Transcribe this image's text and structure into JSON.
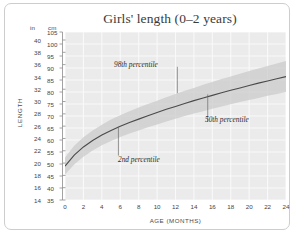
{
  "chart_data": {
    "type": "line",
    "title": "Girls' length (0–2 years)",
    "xlabel": "AGE (MONTHS)",
    "ylabel": "LENGTH",
    "grid": true,
    "legend": "none",
    "y_units": [
      "in",
      "cm"
    ],
    "xlim": [
      0,
      24
    ],
    "ylim_cm": [
      35,
      105
    ],
    "ylim_in": [
      14,
      41.3
    ],
    "xticks": [
      0,
      2,
      4,
      6,
      8,
      10,
      12,
      14,
      16,
      18,
      20,
      22,
      24
    ],
    "yticks_cm": [
      35,
      40,
      45,
      50,
      55,
      60,
      65,
      70,
      75,
      80,
      85,
      90,
      95,
      100,
      105
    ],
    "yticks_in": [
      14,
      16,
      18,
      20,
      22,
      24,
      26,
      28,
      30,
      32,
      34,
      36,
      38,
      40
    ],
    "x": [
      0,
      1,
      2,
      3,
      4,
      5,
      6,
      7,
      8,
      9,
      10,
      11,
      12,
      13,
      14,
      15,
      16,
      17,
      18,
      19,
      20,
      21,
      22,
      23,
      24
    ],
    "series": [
      {
        "name": "2nd percentile",
        "units": "cm",
        "values": [
          45.6,
          49.8,
          53.0,
          55.6,
          57.8,
          59.6,
          61.2,
          62.7,
          64.0,
          65.3,
          66.5,
          67.7,
          68.9,
          70.0,
          71.0,
          72.0,
          73.0,
          74.0,
          74.9,
          75.8,
          76.7,
          77.5,
          78.4,
          79.2,
          80.0
        ]
      },
      {
        "name": "50th percentile",
        "units": "cm",
        "values": [
          49.1,
          53.7,
          57.1,
          59.8,
          62.1,
          64.0,
          65.7,
          67.3,
          68.7,
          70.1,
          71.5,
          72.8,
          74.0,
          75.2,
          76.4,
          77.5,
          78.6,
          79.7,
          80.7,
          81.7,
          82.7,
          83.7,
          84.6,
          85.5,
          86.4
        ]
      },
      {
        "name": "98th percentile",
        "units": "cm",
        "values": [
          52.7,
          57.6,
          61.1,
          64.0,
          66.4,
          68.5,
          70.3,
          72.0,
          73.5,
          75.0,
          76.4,
          77.8,
          79.2,
          80.5,
          81.7,
          83.0,
          84.2,
          85.4,
          86.5,
          87.6,
          88.7,
          89.8,
          90.8,
          91.9,
          92.9
        ]
      }
    ],
    "annotations": [
      {
        "text": "98th percentile",
        "anchor_x": 12.2,
        "anchor_y_cm": 92.0
      },
      {
        "text": "50th percentile",
        "anchor_x": 15.5,
        "anchor_y_cm": 78.0
      },
      {
        "text": "2nd percentile",
        "anchor_x": 5.8,
        "anchor_y_cm": 65.0
      }
    ],
    "colors": {
      "band": "#c9c9c9",
      "median_line": "#4a4a4a",
      "plot_background": "#ebebeb",
      "gridline": "#f7f7f7",
      "text": "#444444",
      "frame": "#cdcdcd"
    }
  }
}
